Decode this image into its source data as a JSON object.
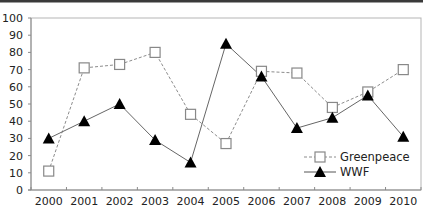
{
  "chart_data": {
    "type": "line",
    "title": "",
    "xlabel": "",
    "ylabel": "",
    "categories": [
      "2000",
      "2001",
      "2002",
      "2003",
      "2004",
      "2005",
      "2006",
      "2007",
      "2008",
      "2009",
      "2010"
    ],
    "ylim": [
      0,
      100
    ],
    "yticks": [
      0,
      10,
      20,
      30,
      40,
      50,
      60,
      70,
      80,
      90,
      100
    ],
    "grid": false,
    "legend_position": "lower right (inside)",
    "series": [
      {
        "name": "Greenpeace",
        "marker": "open-square",
        "line_style": "dashed",
        "color": "#888888",
        "values": [
          11,
          71,
          73,
          80,
          44,
          27,
          69,
          68,
          48,
          57,
          70
        ]
      },
      {
        "name": "WWF",
        "marker": "filled-triangle",
        "line_style": "solid",
        "color": "#555555",
        "values": [
          30,
          40,
          50,
          29,
          16,
          85,
          66,
          36,
          42,
          55,
          31
        ]
      }
    ]
  },
  "colors": {
    "top_bar": "#3a3a3a",
    "axis": "#9a9a9a",
    "frame": "#b0b0b0",
    "marker_fill_triangle": "#000000",
    "marker_fill_square": "#ffffff"
  }
}
